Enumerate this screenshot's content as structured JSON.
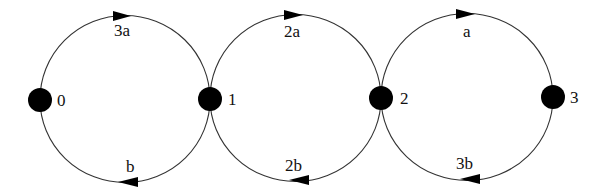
{
  "diagram": {
    "type": "state-transition-chain",
    "nodes": [
      {
        "id": "0",
        "label": "0",
        "x": 40,
        "y": 100
      },
      {
        "id": "1",
        "label": "1",
        "x": 210,
        "y": 99
      },
      {
        "id": "2",
        "label": "2",
        "x": 381,
        "y": 98
      },
      {
        "id": "3",
        "label": "3",
        "x": 553,
        "y": 97
      }
    ],
    "edges": [
      {
        "from": "0",
        "to": "1",
        "label": "3a",
        "direction": "forward",
        "position": "top"
      },
      {
        "from": "1",
        "to": "0",
        "label": "b",
        "direction": "backward",
        "position": "bottom"
      },
      {
        "from": "1",
        "to": "2",
        "label": "2a",
        "direction": "forward",
        "position": "top"
      },
      {
        "from": "2",
        "to": "1",
        "label": "2b",
        "direction": "backward",
        "position": "bottom"
      },
      {
        "from": "2",
        "to": "3",
        "label": "a",
        "direction": "forward",
        "position": "top"
      },
      {
        "from": "3",
        "to": "2",
        "label": "3b",
        "direction": "backward",
        "position": "bottom"
      }
    ],
    "colors": {
      "node": "#000000",
      "edge": "#333333",
      "text": "#111111",
      "background": "#ffffff"
    }
  }
}
